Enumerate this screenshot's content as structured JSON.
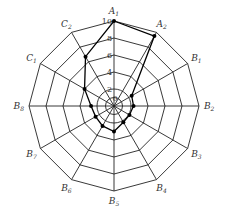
{
  "chart_data": {
    "type": "radar",
    "title": "",
    "axes": [
      "A1",
      "A2",
      "B1",
      "B2",
      "B3",
      "B4",
      "B5",
      "B6",
      "B7",
      "B8",
      "C1",
      "C2"
    ],
    "axis_labels": [
      {
        "main": "A",
        "sub": "1"
      },
      {
        "main": "A",
        "sub": "2"
      },
      {
        "main": "B",
        "sub": "1"
      },
      {
        "main": "B",
        "sub": "2"
      },
      {
        "main": "B",
        "sub": "3"
      },
      {
        "main": "B",
        "sub": "4"
      },
      {
        "main": "B",
        "sub": "5"
      },
      {
        "main": "B",
        "sub": "6"
      },
      {
        "main": "B",
        "sub": "7"
      },
      {
        "main": "B",
        "sub": "8"
      },
      {
        "main": "C",
        "sub": "1"
      },
      {
        "main": "C",
        "sub": "2"
      }
    ],
    "values": [
      10,
      9.5,
      2.4,
      2.3,
      2.1,
      2.2,
      3.0,
      2.7,
      2.5,
      2.7,
      4.0,
      6.7
    ],
    "rlim": [
      0,
      10
    ],
    "radial_ticks": [
      0,
      2,
      4,
      6,
      8,
      10
    ],
    "circular_rings": [
      1,
      2
    ],
    "polygon_rings": [
      4,
      6,
      8,
      10
    ],
    "grid": true,
    "legend": null
  },
  "layout": {
    "cx": 114,
    "cy": 106,
    "radius": 85
  }
}
